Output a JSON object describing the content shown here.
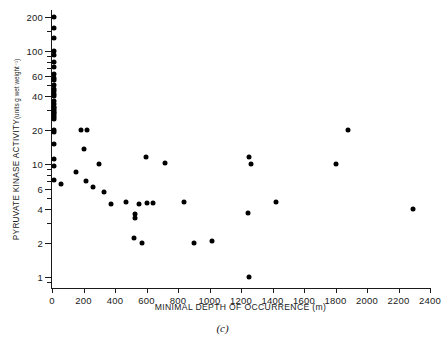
{
  "chart_data": {
    "type": "scatter",
    "title": "",
    "panel_label": "(c)",
    "xlabel": "MINIMAL DEPTH OF OCCURRENCE (m)",
    "ylabel_main": "PYRUVATE KINASE ACTIVITY",
    "ylabel_units": "(units g wet weight⁻¹)",
    "xscale": "linear",
    "yscale": "log",
    "xlim": [
      0,
      2400
    ],
    "ylim": [
      0.8,
      230
    ],
    "grid": false,
    "legend": null,
    "xticks": [
      0,
      200,
      400,
      600,
      800,
      1000,
      1200,
      1400,
      1600,
      1800,
      2000,
      2200,
      2400
    ],
    "xticklabels": [
      "0",
      "200",
      "400",
      "600",
      "800",
      "1000",
      "1200",
      "1400",
      "1600",
      "1800",
      "2000",
      "2200",
      "2400"
    ],
    "yticks": [
      1,
      2,
      4,
      6,
      10,
      20,
      40,
      60,
      100,
      200
    ],
    "yticklabels": [
      "1",
      "2",
      "4",
      "6",
      "10",
      "20",
      "40",
      "60",
      "100",
      "200"
    ],
    "yminorticks": [
      0.9,
      3,
      5,
      7,
      8,
      9,
      30,
      50,
      70,
      80,
      90,
      150
    ],
    "points": [
      [
        10,
        200
      ],
      [
        12,
        160
      ],
      [
        10,
        130
      ],
      [
        14,
        100
      ],
      [
        10,
        92
      ],
      [
        12,
        80
      ],
      [
        10,
        72
      ],
      [
        12,
        62
      ],
      [
        10,
        58
      ],
      [
        14,
        55
      ],
      [
        10,
        50
      ],
      [
        12,
        46
      ],
      [
        10,
        44
      ],
      [
        14,
        42
      ],
      [
        10,
        40
      ],
      [
        12,
        36
      ],
      [
        10,
        34
      ],
      [
        14,
        32
      ],
      [
        10,
        31
      ],
      [
        12,
        30
      ],
      [
        10,
        29
      ],
      [
        14,
        28
      ],
      [
        10,
        27
      ],
      [
        12,
        26
      ],
      [
        10,
        25
      ],
      [
        10,
        20
      ],
      [
        12,
        19
      ],
      [
        10,
        15
      ],
      [
        12,
        11
      ],
      [
        10,
        9.5
      ],
      [
        10,
        7.2
      ],
      [
        55,
        6.7
      ],
      [
        185,
        20
      ],
      [
        225,
        20
      ],
      [
        205,
        13.5
      ],
      [
        300,
        10
      ],
      [
        150,
        8.5
      ],
      [
        215,
        7.0
      ],
      [
        260,
        6.3
      ],
      [
        330,
        5.6
      ],
      [
        375,
        4.4
      ],
      [
        470,
        4.6
      ],
      [
        525,
        3.6
      ],
      [
        525,
        3.3
      ],
      [
        520,
        2.2
      ],
      [
        570,
        2.0
      ],
      [
        555,
        4.4
      ],
      [
        600,
        4.5
      ],
      [
        640,
        4.5
      ],
      [
        595,
        11.5
      ],
      [
        715,
        10.2
      ],
      [
        835,
        4.6
      ],
      [
        900,
        2.0
      ],
      [
        1015,
        2.1
      ],
      [
        1250,
        11.5
      ],
      [
        1265,
        10
      ],
      [
        1245,
        3.7
      ],
      [
        1250,
        1.0
      ],
      [
        1420,
        4.6
      ],
      [
        1800,
        10
      ],
      [
        1880,
        20
      ],
      [
        2290,
        4.0
      ]
    ]
  }
}
